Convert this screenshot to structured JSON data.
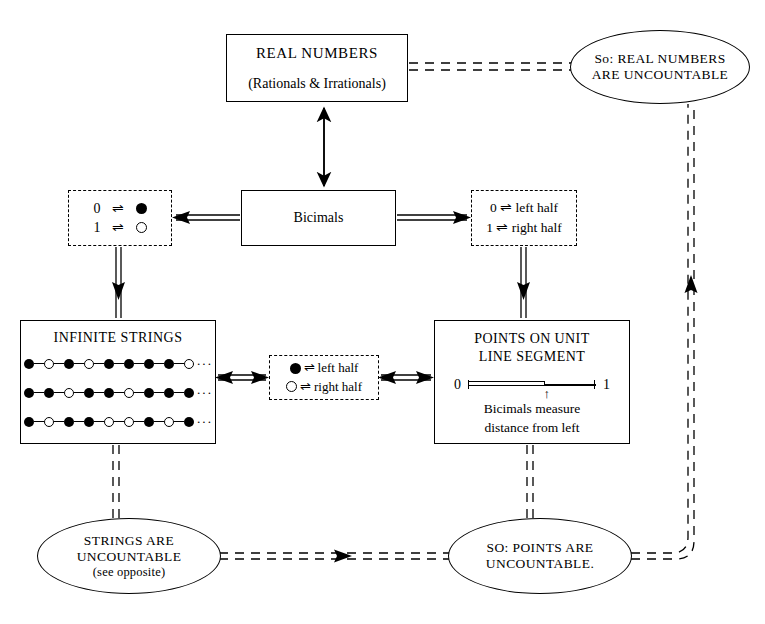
{
  "diagram": {
    "nodes": {
      "real_numbers": {
        "title": "REAL NUMBERS",
        "subtitle": "(Rationals & Irrationals)"
      },
      "bicimals": {
        "label": "Bicimals"
      },
      "map_left": {
        "rows": [
          {
            "left": "0",
            "rel": "⇌",
            "right_icon": "filled-dot"
          },
          {
            "left": "1",
            "rel": "⇌",
            "right_icon": "open-dot"
          }
        ]
      },
      "map_right": {
        "lines": [
          "0 ⇌ left half",
          "1 ⇌ right half"
        ]
      },
      "map_mid": {
        "lines": [
          {
            "icon": "filled-dot",
            "rel": "⇌",
            "text": "left half"
          },
          {
            "icon": "open-dot",
            "rel": "⇌",
            "text": "right half"
          }
        ]
      },
      "infinite_strings": {
        "title": "INFINITE STRINGS",
        "ellipsis": "···",
        "rows": [
          [
            "filled",
            "open",
            "filled",
            "open",
            "filled",
            "filled",
            "filled",
            "filled",
            "open"
          ],
          [
            "filled",
            "filled",
            "open",
            "filled",
            "filled",
            "open",
            "filled",
            "filled",
            "filled"
          ],
          [
            "filled",
            "open",
            "filled",
            "filled",
            "open",
            "open",
            "filled",
            "open",
            "filled"
          ]
        ]
      },
      "points": {
        "title_line1": "POINTS ON UNIT",
        "title_line2": "LINE SEGMENT",
        "left_label": "0",
        "right_label": "1",
        "marker": "↑",
        "caption_line1": "Bicimals measure",
        "caption_line2": "distance from left"
      }
    },
    "conclusions": {
      "real_uncountable": {
        "line1": "So: REAL NUMBERS",
        "line2": "ARE UNCOUNTABLE"
      },
      "strings_uncountable": {
        "line1": "STRINGS ARE",
        "line2": "UNCOUNTABLE",
        "line3": "(see opposite)"
      },
      "points_uncountable": {
        "line1": "SO: POINTS ARE",
        "line2": "UNCOUNTABLE."
      }
    },
    "colors": {
      "ink": "#000000",
      "paper": "#ffffff"
    }
  }
}
